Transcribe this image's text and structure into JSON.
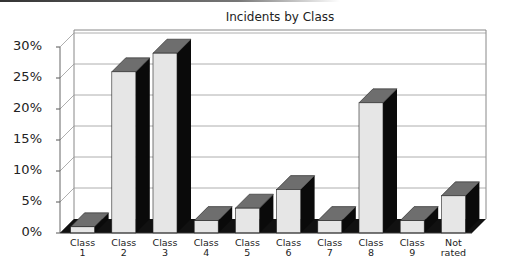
{
  "chart_data": {
    "type": "bar",
    "style": "3d-column",
    "title": "Incidents by Class",
    "xlabel": "",
    "ylabel": "",
    "categories": [
      "Class 1",
      "Class 2",
      "Class 3",
      "Class 4",
      "Class 5",
      "Class 6",
      "Class 7",
      "Class 8",
      "Class 9",
      "Not rated"
    ],
    "category_labels": [
      "Class\n1",
      "Class\n2",
      "Class\n3",
      "Class\n4",
      "Class\n5",
      "Class\n6",
      "Class\n7",
      "Class\n8",
      "Class\n9",
      "Not\nrated"
    ],
    "values": [
      1,
      26,
      29,
      2,
      4,
      7,
      2,
      21,
      2,
      6
    ],
    "unit": "%",
    "ylim": [
      0,
      30
    ],
    "yticks": [
      "0%",
      "5%",
      "10%",
      "15%",
      "20%",
      "25%",
      "30%"
    ],
    "grid": true,
    "legend": "none",
    "colors": {
      "front": "#e6e6e6",
      "top": "#6e6e6e",
      "side": "#0a0a0a",
      "grid": "#999999"
    }
  }
}
